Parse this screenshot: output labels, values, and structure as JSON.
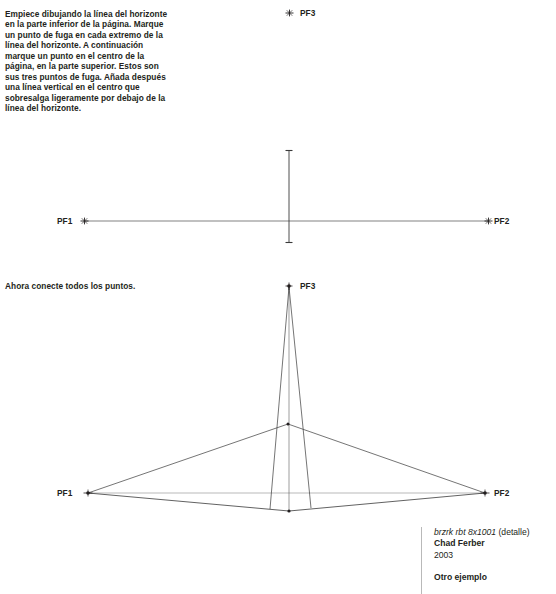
{
  "instructions": {
    "step1": "Empiece dibujando la línea del horizonte en la parte inferior de la página. Marque un punto de fuga en cada extremo de la línea del horizonte. A continuación marque un punto en el centro de la página, en la parte superior. Estos son sus tres puntos de fuga. Añada después una línea vertical en el centro que sobresalga ligeramente por debajo de la línea del horizonte.",
    "step2": "Ahora conecte todos los puntos."
  },
  "diagram_top": {
    "labels": {
      "pf1": "PF1",
      "pf2": "PF2",
      "pf3": "PF3"
    }
  },
  "diagram_bottom": {
    "labels": {
      "pf1": "PF1",
      "pf2": "PF2",
      "pf3": "PF3"
    }
  },
  "caption": {
    "artwork_title": "brzrk rbt 8x1001",
    "artwork_detail": " (detalle)",
    "author": "Chad Ferber",
    "year": "2003",
    "next_section": "Otro ejemplo"
  },
  "colors": {
    "ink": "#231f20",
    "line": "#3a3a3a",
    "rule": "#b9b9b9",
    "background": "#ffffff"
  }
}
